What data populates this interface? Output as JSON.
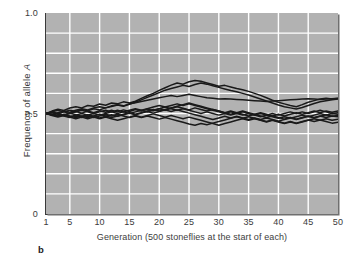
{
  "figure": {
    "panel_label": "b"
  },
  "chart_data": {
    "type": "line",
    "title": "",
    "subtitle": "",
    "xlabel": "Generation (500 stoneflies at the start of each)",
    "ylabel": "Frequency of allele A",
    "ylabel_plain": "Frequency of allele ",
    "ylabel_italic": "A",
    "xlim": [
      1,
      50
    ],
    "ylim": [
      0,
      1.0
    ],
    "grid": true,
    "grid_color": "#ffffff",
    "plot_background": "#b2b2b2",
    "line_color": "#1a1a1a",
    "legend_position": "none",
    "y_tick_labels": [
      "1.0",
      "0.5",
      "0"
    ],
    "y_tick_values": [
      1.0,
      0.5,
      0
    ],
    "y_gridline_values": [
      0.1,
      0.2,
      0.3,
      0.4,
      0.5,
      0.6,
      0.7,
      0.8,
      0.9
    ],
    "x_tick_labels": [
      "1",
      "5",
      "10",
      "15",
      "20",
      "25",
      "30",
      "35",
      "40",
      "45",
      "50"
    ],
    "x_tick_values": [
      1,
      5,
      10,
      15,
      20,
      25,
      30,
      35,
      40,
      45,
      50
    ],
    "x_gridline_values": [
      5,
      10,
      15,
      20,
      25,
      30,
      35,
      40,
      45
    ],
    "x": [
      1,
      2,
      3,
      4,
      5,
      6,
      7,
      8,
      9,
      10,
      11,
      12,
      13,
      14,
      15,
      16,
      17,
      18,
      19,
      20,
      21,
      22,
      23,
      24,
      25,
      26,
      27,
      28,
      29,
      30,
      31,
      32,
      33,
      34,
      35,
      36,
      37,
      38,
      39,
      40,
      41,
      42,
      43,
      44,
      45,
      46,
      47,
      48,
      49,
      50
    ],
    "series": [
      {
        "name": "population 1",
        "values": [
          0.5,
          0.512,
          0.521,
          0.515,
          0.527,
          0.534,
          0.528,
          0.54,
          0.536,
          0.547,
          0.541,
          0.552,
          0.548,
          0.558,
          0.552,
          0.561,
          0.575,
          0.588,
          0.6,
          0.615,
          0.628,
          0.641,
          0.652,
          0.646,
          0.658,
          0.664,
          0.66,
          0.652,
          0.644,
          0.636,
          0.64,
          0.632,
          0.624,
          0.618,
          0.61,
          0.6,
          0.59,
          0.578,
          0.566,
          0.556,
          0.548,
          0.54,
          0.534,
          0.544,
          0.556,
          0.564,
          0.572,
          0.576,
          0.572,
          0.575
        ]
      },
      {
        "name": "population 2",
        "values": [
          0.5,
          0.506,
          0.498,
          0.508,
          0.516,
          0.51,
          0.52,
          0.514,
          0.524,
          0.518,
          0.528,
          0.535,
          0.542,
          0.536,
          0.546,
          0.556,
          0.568,
          0.58,
          0.592,
          0.604,
          0.616,
          0.624,
          0.632,
          0.64,
          0.634,
          0.644,
          0.652,
          0.646,
          0.638,
          0.63,
          0.622,
          0.614,
          0.608,
          0.6,
          0.592,
          0.582,
          0.572,
          0.562,
          0.552,
          0.542,
          0.534,
          0.528,
          0.522,
          0.53,
          0.54,
          0.55,
          0.558,
          0.564,
          0.568,
          0.572
        ]
      },
      {
        "name": "population 3",
        "values": [
          0.5,
          0.494,
          0.504,
          0.512,
          0.506,
          0.516,
          0.524,
          0.518,
          0.528,
          0.534,
          0.528,
          0.538,
          0.544,
          0.538,
          0.548,
          0.554,
          0.56,
          0.566,
          0.572,
          0.578,
          0.584,
          0.59,
          0.584,
          0.59,
          0.596,
          0.59,
          0.584,
          0.578,
          0.576,
          0.572,
          0.574,
          0.572,
          0.57,
          0.568,
          0.566,
          0.564,
          0.562,
          0.56,
          0.562,
          0.564,
          0.566,
          0.568,
          0.57,
          0.572,
          0.574,
          0.572,
          0.57,
          0.572,
          0.574,
          0.576
        ]
      },
      {
        "name": "population 4",
        "values": [
          0.5,
          0.508,
          0.516,
          0.508,
          0.5,
          0.51,
          0.502,
          0.512,
          0.504,
          0.514,
          0.506,
          0.516,
          0.508,
          0.518,
          0.51,
          0.52,
          0.512,
          0.522,
          0.514,
          0.524,
          0.516,
          0.526,
          0.534,
          0.526,
          0.518,
          0.528,
          0.52,
          0.512,
          0.52,
          0.512,
          0.504,
          0.512,
          0.504,
          0.512,
          0.504,
          0.496,
          0.504,
          0.496,
          0.488,
          0.496,
          0.488,
          0.496,
          0.504,
          0.496,
          0.504,
          0.512,
          0.504,
          0.512,
          0.506,
          0.512
        ]
      },
      {
        "name": "population 5",
        "values": [
          0.5,
          0.492,
          0.5,
          0.492,
          0.484,
          0.492,
          0.5,
          0.492,
          0.5,
          0.492,
          0.5,
          0.508,
          0.5,
          0.508,
          0.5,
          0.508,
          0.516,
          0.508,
          0.516,
          0.524,
          0.532,
          0.54,
          0.548,
          0.54,
          0.548,
          0.54,
          0.532,
          0.524,
          0.516,
          0.508,
          0.5,
          0.508,
          0.5,
          0.492,
          0.5,
          0.492,
          0.484,
          0.492,
          0.484,
          0.476,
          0.484,
          0.476,
          0.484,
          0.492,
          0.484,
          0.492,
          0.5,
          0.492,
          0.5,
          0.496
        ]
      },
      {
        "name": "population 6",
        "values": [
          0.5,
          0.496,
          0.488,
          0.496,
          0.488,
          0.48,
          0.488,
          0.48,
          0.488,
          0.496,
          0.488,
          0.48,
          0.488,
          0.496,
          0.504,
          0.496,
          0.504,
          0.512,
          0.52,
          0.512,
          0.52,
          0.528,
          0.536,
          0.544,
          0.552,
          0.544,
          0.536,
          0.528,
          0.52,
          0.512,
          0.504,
          0.496,
          0.504,
          0.496,
          0.488,
          0.496,
          0.488,
          0.48,
          0.488,
          0.48,
          0.472,
          0.48,
          0.472,
          0.48,
          0.488,
          0.48,
          0.488,
          0.48,
          0.488,
          0.484
        ]
      },
      {
        "name": "population 7",
        "values": [
          0.5,
          0.49,
          0.482,
          0.49,
          0.482,
          0.474,
          0.482,
          0.474,
          0.482,
          0.474,
          0.482,
          0.474,
          0.466,
          0.474,
          0.482,
          0.49,
          0.482,
          0.49,
          0.498,
          0.49,
          0.482,
          0.49,
          0.482,
          0.474,
          0.482,
          0.474,
          0.466,
          0.458,
          0.45,
          0.442,
          0.45,
          0.458,
          0.466,
          0.474,
          0.466,
          0.474,
          0.466,
          0.458,
          0.466,
          0.458,
          0.45,
          0.458,
          0.45,
          0.458,
          0.466,
          0.474,
          0.466,
          0.474,
          0.466,
          0.472
        ]
      },
      {
        "name": "population 8",
        "values": [
          0.5,
          0.504,
          0.496,
          0.488,
          0.48,
          0.488,
          0.48,
          0.488,
          0.48,
          0.488,
          0.496,
          0.488,
          0.496,
          0.488,
          0.48,
          0.488,
          0.48,
          0.488,
          0.48,
          0.472,
          0.48,
          0.472,
          0.464,
          0.456,
          0.448,
          0.442,
          0.45,
          0.444,
          0.452,
          0.46,
          0.468,
          0.476,
          0.484,
          0.476,
          0.484,
          0.476,
          0.468,
          0.46,
          0.468,
          0.46,
          0.452,
          0.46,
          0.452,
          0.46,
          0.468,
          0.46,
          0.468,
          0.46,
          0.452,
          0.456
        ]
      },
      {
        "name": "population 9",
        "values": [
          0.5,
          0.494,
          0.486,
          0.494,
          0.502,
          0.494,
          0.486,
          0.494,
          0.486,
          0.478,
          0.486,
          0.494,
          0.486,
          0.494,
          0.502,
          0.494,
          0.502,
          0.51,
          0.502,
          0.51,
          0.518,
          0.51,
          0.518,
          0.51,
          0.502,
          0.494,
          0.486,
          0.478,
          0.47,
          0.478,
          0.486,
          0.478,
          0.486,
          0.478,
          0.47,
          0.478,
          0.47,
          0.478,
          0.47,
          0.462,
          0.47,
          0.478,
          0.47,
          0.478,
          0.486,
          0.478,
          0.486,
          0.494,
          0.486,
          0.49
        ]
      },
      {
        "name": "population 10",
        "values": [
          0.5,
          0.508,
          0.5,
          0.492,
          0.5,
          0.508,
          0.516,
          0.508,
          0.5,
          0.508,
          0.516,
          0.508,
          0.516,
          0.508,
          0.516,
          0.524,
          0.516,
          0.524,
          0.532,
          0.54,
          0.532,
          0.524,
          0.516,
          0.524,
          0.516,
          0.508,
          0.5,
          0.508,
          0.5,
          0.492,
          0.5,
          0.492,
          0.5,
          0.508,
          0.5,
          0.492,
          0.5,
          0.492,
          0.5,
          0.492,
          0.5,
          0.508,
          0.5,
          0.508,
          0.5,
          0.508,
          0.516,
          0.508,
          0.5,
          0.504
        ]
      }
    ]
  }
}
